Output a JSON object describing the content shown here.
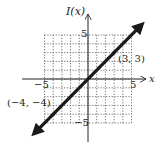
{
  "chart_data": {
    "type": "line",
    "title": "",
    "xlabel": "x",
    "ylabel": "I(x)",
    "xlim": [
      -5,
      5
    ],
    "ylim": [
      -5,
      5
    ],
    "grid": true,
    "grid_style": "dotted",
    "x_ticks_labeled": [
      "-5",
      "5"
    ],
    "y_ticks_labeled": [
      "5",
      "-5"
    ],
    "series": [
      {
        "name": "I(x) = x",
        "x": [
          -6,
          6
        ],
        "y": [
          -6,
          6
        ],
        "arrows_both_ends": true
      }
    ],
    "points": [
      {
        "x": 3,
        "y": 3,
        "label": "(3, 3)"
      },
      {
        "x": -4,
        "y": -4,
        "label": "(-4, -4)"
      }
    ],
    "annotations": [
      "(3, 3)",
      "(-4, -4)"
    ]
  },
  "labels": {
    "y_axis": "I(x)",
    "x_axis": "x",
    "x_min": "−5",
    "x_max": "5",
    "y_max": "5",
    "y_min": "−5",
    "point_a": "(3, 3)",
    "point_b": "(−4, −4)"
  },
  "colors": {
    "line": "#1a1a1a",
    "grid": "#555555",
    "axis": "#222222"
  }
}
